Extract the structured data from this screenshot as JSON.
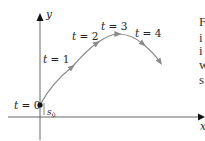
{
  "diagram": {
    "type": "parametric-trajectory",
    "axes": {
      "x_label": "x",
      "y_label": "y",
      "initial_position_label": "s",
      "initial_position_subscript": "0"
    },
    "points": [
      {
        "label_var": "t",
        "label_eq": " = ",
        "label_val": "0"
      },
      {
        "label_var": "t",
        "label_eq": " = ",
        "label_val": "1"
      },
      {
        "label_var": "t",
        "label_eq": " = ",
        "label_val": "2"
      },
      {
        "label_var": "t",
        "label_eq": " = ",
        "label_val": "3"
      },
      {
        "label_var": "t",
        "label_eq": " = ",
        "label_val": "4"
      }
    ],
    "colors": {
      "curve": "#8a8a8a",
      "axes": "#333333",
      "text": "#222222"
    }
  },
  "side_text": {
    "lines": [
      "F",
      "i",
      "i",
      "w",
      "s"
    ]
  }
}
